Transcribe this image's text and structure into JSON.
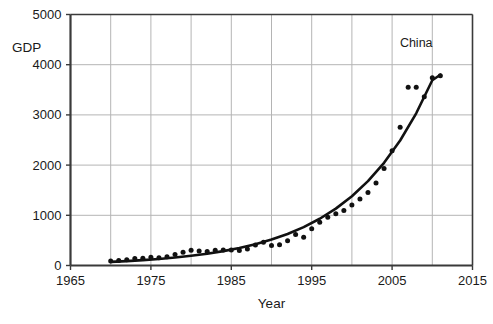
{
  "chart_data": {
    "type": "scatter",
    "title": "",
    "subtitle": "",
    "xlabel": "Year",
    "ylabel": "GDP",
    "xlim": [
      1965,
      2015
    ],
    "ylim": [
      0,
      5000
    ],
    "xticks": [
      1965,
      1975,
      1985,
      1995,
      2005,
      2015
    ],
    "xticklabels": [
      "1965",
      "1975",
      "1985",
      "1995",
      "2005",
      "2015"
    ],
    "x_minor_gridlines": [
      1970,
      1980,
      1990,
      2000,
      2010
    ],
    "yticks": [
      0,
      1000,
      2000,
      3000,
      4000,
      5000
    ],
    "yticklabels": [
      "0",
      "1000",
      "2000",
      "3000",
      "4000",
      "5000"
    ],
    "grid": true,
    "legend_position": "top-right-inside",
    "annotations": [
      {
        "text": "China",
        "x": 2008,
        "y": 4350
      }
    ],
    "series": [
      {
        "name": "China",
        "kind": "scatter",
        "marker": "circle",
        "color": "#111111",
        "x": [
          1970,
          1971,
          1972,
          1973,
          1974,
          1975,
          1976,
          1977,
          1978,
          1979,
          1980,
          1981,
          1982,
          1983,
          1984,
          1985,
          1986,
          1987,
          1988,
          1989,
          1990,
          1991,
          1992,
          1993,
          1994,
          1995,
          1996,
          1997,
          1998,
          1999,
          2000,
          2001,
          2002,
          2003,
          2004,
          2005,
          2006,
          2007,
          2008,
          2009,
          2010,
          2011
        ],
        "values": [
          92,
          99,
          113,
          138,
          144,
          163,
          153,
          174,
          218,
          263,
          303,
          289,
          281,
          302,
          310,
          309,
          298,
          327,
          409,
          461,
          398,
          413,
          494,
          618,
          564,
          734,
          863,
          962,
          1029,
          1094,
          1205,
          1324,
          1454,
          1641,
          1932,
          2286,
          2752,
          3552,
          3550,
          3360,
          3740,
          3780
        ]
      },
      {
        "name": "Exponential fit",
        "kind": "line",
        "color": "#111111",
        "x": [
          1970,
          1972,
          1974,
          1976,
          1978,
          1980,
          1982,
          1984,
          1986,
          1988,
          1990,
          1992,
          1994,
          1996,
          1998,
          2000,
          2002,
          2004,
          2006,
          2008,
          2010,
          2011
        ],
        "values": [
          72,
          88,
          107,
          130,
          158,
          193,
          235,
          286,
          348,
          424,
          516,
          628,
          765,
          931,
          1133,
          1380,
          1680,
          2045,
          2490,
          3032,
          3691,
          3800
        ]
      }
    ]
  },
  "axes": {
    "y_axis_label": "GDP",
    "x_axis_label": "Year"
  },
  "colors": {
    "ink": "#111111",
    "grid": "#b4b4b4",
    "frame": "#3a3a3a",
    "background": "#ffffff"
  }
}
